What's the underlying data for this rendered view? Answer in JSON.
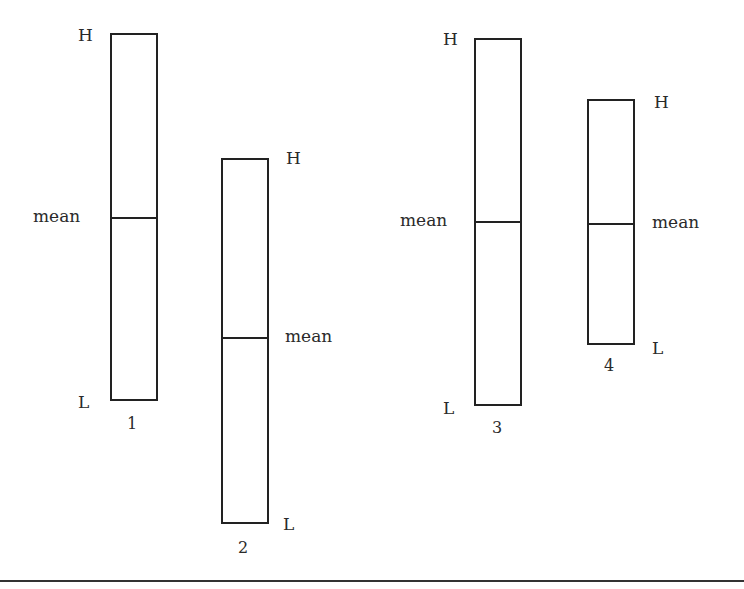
{
  "diagram": {
    "type": "range-bars",
    "labels": {
      "high": "H",
      "low": "L",
      "mean": "mean"
    },
    "bars": [
      {
        "id": "1",
        "number_label": "1",
        "high_label": "H",
        "low_label": "L",
        "mean_label": "mean",
        "label_side_high": "left",
        "label_side_low": "left",
        "label_side_mean": "left",
        "x": 110,
        "width": 48,
        "top": 33,
        "bottom": 400,
        "mean_y": 218
      },
      {
        "id": "2",
        "number_label": "2",
        "high_label": "H",
        "low_label": "L",
        "mean_label": "mean",
        "label_side_high": "right",
        "label_side_low": "right",
        "label_side_mean": "right",
        "x": 221,
        "width": 48,
        "top": 158,
        "bottom": 523,
        "mean_y": 338
      },
      {
        "id": "3",
        "number_label": "3",
        "high_label": "H",
        "low_label": "L",
        "mean_label": "mean",
        "label_side_high": "left",
        "label_side_low": "left",
        "label_side_mean": "left",
        "x": 474,
        "width": 48,
        "top": 38,
        "bottom": 405,
        "mean_y": 222
      },
      {
        "id": "4",
        "number_label": "4",
        "high_label": "H",
        "low_label": "L",
        "mean_label": "mean",
        "label_side_high": "right",
        "label_side_low": "right",
        "label_side_mean": "right",
        "x": 587,
        "width": 48,
        "top": 99,
        "bottom": 344,
        "mean_y": 223
      }
    ]
  }
}
